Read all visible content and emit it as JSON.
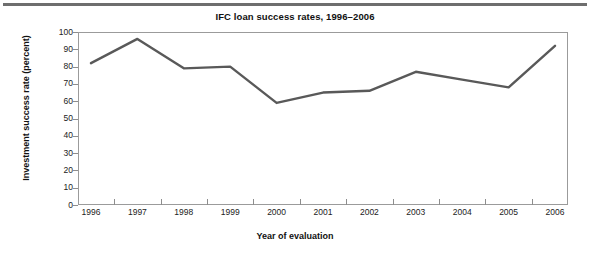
{
  "figure": {
    "title": "IFC loan success rates, 1996–2006",
    "xlabel": "Year of evaluation",
    "ylabel": "Investment success rate (percent)"
  },
  "axes": {
    "y_ticks": [
      "100",
      "90",
      "80",
      "70",
      "60",
      "50",
      "40",
      "30",
      "20",
      "10",
      "0"
    ],
    "x_ticks": [
      "1996",
      "1997",
      "1998",
      "1999",
      "2000",
      "2001",
      "2002",
      "2003",
      "2004",
      "2005",
      "2006"
    ]
  },
  "style": {
    "line_color": "#595959",
    "frame_color": "#9b9b9b",
    "rule_color": "#6e6e6e",
    "text_color": "#111111"
  },
  "chart_data": {
    "type": "line",
    "title": "IFC loan success rates, 1996–2006",
    "xlabel": "Year of evaluation",
    "ylabel": "Investment success rate (percent)",
    "categories": [
      "1996",
      "1997",
      "1998",
      "1999",
      "2000",
      "2001",
      "2002",
      "2003",
      "2004",
      "2005",
      "2006"
    ],
    "values": [
      82,
      96,
      79,
      80,
      59,
      65,
      66,
      77,
      72.5,
      68,
      92
    ],
    "ylim": [
      0,
      100
    ],
    "ytick_step": 10,
    "grid": false,
    "legend": null,
    "series": [
      {
        "name": "Investment success rate (percent)",
        "values": [
          82,
          96,
          79,
          80,
          59,
          65,
          66,
          77,
          72.5,
          68,
          92
        ]
      }
    ]
  }
}
